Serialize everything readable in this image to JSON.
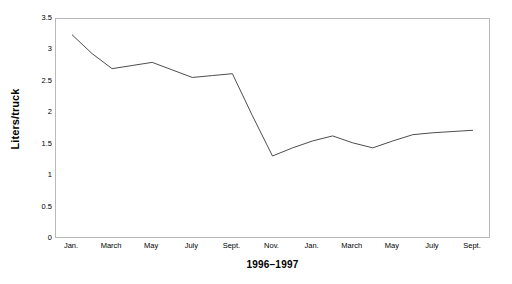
{
  "chart_data": {
    "type": "line",
    "title": "",
    "subtitle": "",
    "xlabel": "1996–1997",
    "ylabel": "Liters/truck",
    "ylim": [
      0,
      3.5
    ],
    "yticks": [
      "0",
      "0.5",
      "1",
      "1.5",
      "2",
      "2.5",
      "3",
      "3.5"
    ],
    "ytick_values": [
      0,
      0.5,
      1,
      1.5,
      2,
      2.5,
      3,
      3.5
    ],
    "grid": false,
    "legend": null,
    "legend_position": "none",
    "line_color": "#4d4d4d",
    "frame_color": "#b9b9b9",
    "x_tick_labels": [
      "Jan.",
      "March",
      "May",
      "July",
      "Sept.",
      "Nov.",
      "Jan.",
      "March",
      "May",
      "July",
      "Sept."
    ],
    "x": [
      "Jan. 1996",
      "Feb. 1996",
      "March 1996",
      "April 1996",
      "May 1996",
      "June 1996",
      "July 1996",
      "Aug. 1996",
      "Sept. 1996",
      "Oct. 1996",
      "Nov. 1996",
      "Dec. 1996",
      "Jan. 1997",
      "Feb. 1997",
      "March 1997",
      "April 1997",
      "May 1997",
      "June 1997",
      "July 1997",
      "Aug. 1997",
      "Sept. 1997"
    ],
    "values": [
      3.25,
      2.95,
      2.71,
      2.76,
      2.81,
      2.69,
      2.57,
      2.6,
      2.63,
      1.96,
      1.32,
      1.45,
      1.56,
      1.64,
      1.53,
      1.45,
      1.56,
      1.66,
      1.69,
      1.71,
      1.73
    ],
    "annotations": []
  }
}
